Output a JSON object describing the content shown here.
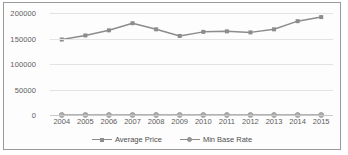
{
  "chart_data": {
    "type": "line",
    "title": "",
    "xlabel": "",
    "ylabel": "",
    "categories": [
      "2004",
      "2005",
      "2006",
      "2007",
      "2008",
      "2009",
      "2010",
      "2011",
      "2012",
      "2013",
      "2014",
      "2015"
    ],
    "series": [
      {
        "name": "Average Price",
        "marker": "square",
        "color": "#8c8c8c",
        "values": [
          148000,
          156000,
          166000,
          180000,
          168000,
          155000,
          163000,
          164000,
          162000,
          168000,
          184000,
          192000
        ]
      },
      {
        "name": "Min Base Rate",
        "marker": "circle",
        "color": "#9a9a9a",
        "values": [
          0,
          0,
          0,
          0,
          0,
          0,
          0,
          0,
          0,
          0,
          0,
          0
        ]
      }
    ],
    "ylim": [
      0,
      200000
    ],
    "yticks": [
      0,
      50000,
      100000,
      150000,
      200000
    ],
    "ytick_labels": [
      "0",
      "50000",
      "100000",
      "150000",
      "200000"
    ],
    "grid": true,
    "legend_position": "bottom"
  },
  "legend": {
    "items": [
      {
        "label": "Average Price",
        "marker": "square-marker-icon"
      },
      {
        "label": "Min Base Rate",
        "marker": "circle-marker-icon"
      }
    ]
  },
  "colors": {
    "series_primary": "#8c8c8c",
    "series_secondary": "#9a9a9a",
    "gridline": "#e3e3e3",
    "axis": "#c9c9c9",
    "text": "#5c5c5c",
    "border": "#9a9a9a",
    "background": "#fdfdfd"
  }
}
